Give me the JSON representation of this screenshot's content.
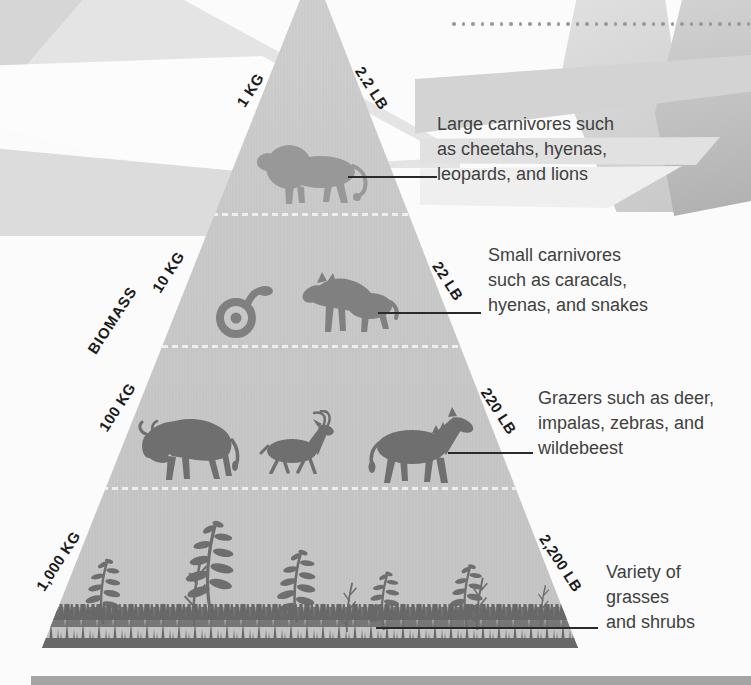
{
  "diagram": {
    "axis_label": "BIOMASS",
    "levels": [
      {
        "id": "large-carnivores",
        "kg_label": "1 KG",
        "lb_label": "2.2 LB",
        "annotation_lines": [
          "Large carnivores such",
          "as cheetahs, hyenas,",
          "leopards, and lions"
        ],
        "animals": [
          "lion"
        ]
      },
      {
        "id": "small-carnivores",
        "kg_label": "10 KG",
        "lb_label": "22 LB",
        "annotation_lines": [
          "Small carnivores",
          "such as caracals,",
          "hyenas, and snakes"
        ],
        "animals": [
          "snake",
          "hyena"
        ]
      },
      {
        "id": "grazers",
        "kg_label": "100 KG",
        "lb_label": "220 LB",
        "annotation_lines": [
          "Grazers such as deer,",
          "impalas, zebras, and",
          "wildebeest"
        ],
        "animals": [
          "wildebeest",
          "impala",
          "zebra"
        ]
      },
      {
        "id": "producers",
        "kg_label": "1,000 KG",
        "lb_label": "2,200 LB",
        "annotation_lines": [
          "Variety of",
          "grasses",
          "and shrubs"
        ],
        "animals": [
          "grasses",
          "shrubs"
        ]
      }
    ],
    "colors": {
      "pyramid": "#c7c7c7",
      "silhouette_level1": "#989898",
      "silhouette_level2": "#808080",
      "silhouette_level3": "#6f6f6f",
      "silhouette_level4": "#686868",
      "annotation_text": "#3f3f3f",
      "weight_label_text": "#1c1c1c",
      "bottom_bar": "#a4a4a4"
    }
  }
}
